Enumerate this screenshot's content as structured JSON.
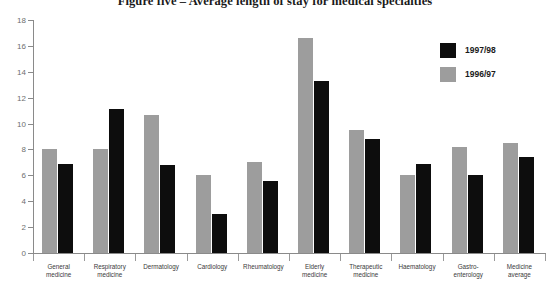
{
  "chart_data": {
    "type": "bar",
    "title": "Figure five – Average length of stay for medical specialties",
    "xlabel": "",
    "ylabel": "",
    "ylim": [
      0,
      18
    ],
    "ytick_step": 2,
    "yticks": [
      0,
      2,
      4,
      6,
      8,
      10,
      12,
      14,
      16,
      18
    ],
    "grid": false,
    "legend_position": "top-right",
    "categories": [
      "General medicine",
      "Respiratory medicine",
      "Dermatology",
      "Cardiology",
      "Rheumatology",
      "Elderly medicine",
      "Therapeutic medicine",
      "Haematology",
      "Gastro-enterology",
      "Medicine average"
    ],
    "category_lines": [
      [
        "General",
        "medicine"
      ],
      [
        "Respiratory",
        "medicine"
      ],
      [
        "Dermatology"
      ],
      [
        "Cardiology"
      ],
      [
        "Rheumatology"
      ],
      [
        "Elderly",
        "medicine"
      ],
      [
        "Therapeutic",
        "medicine"
      ],
      [
        "Haematology"
      ],
      [
        "Gastro-",
        "enterology"
      ],
      [
        "Medicine",
        "average"
      ]
    ],
    "series": [
      {
        "name": "1997/98",
        "color": "#0d0d0d",
        "values": [
          6.9,
          11.1,
          6.8,
          3.0,
          5.6,
          13.3,
          8.8,
          6.9,
          6.0,
          7.4
        ]
      },
      {
        "name": "1996/97",
        "color": "#9d9d9d",
        "values": [
          8.0,
          8.0,
          10.7,
          6.0,
          7.0,
          16.6,
          9.5,
          6.0,
          8.2,
          8.5
        ]
      }
    ]
  },
  "legend": {
    "items": [
      {
        "label": "1997/98",
        "swatch": "black"
      },
      {
        "label": "1996/97",
        "swatch": "gray"
      }
    ]
  }
}
